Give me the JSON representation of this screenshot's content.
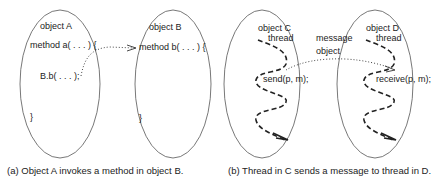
{
  "panel_a": {
    "object_a": {
      "title": "object A",
      "method_line": "method a( . . . ) {",
      "call_line": "B.b( . . . );",
      "close_brace": "}"
    },
    "object_b": {
      "title": "object B",
      "method_line": "method b( . . . ) {",
      "close_brace": "}"
    },
    "caption": "(a) Object A invokes a method in object B."
  },
  "panel_b": {
    "object_c": {
      "title": "object C",
      "thread_label": "thread",
      "send_line": "send(p, m);"
    },
    "object_d": {
      "title": "object D",
      "thread_label": "thread",
      "receive_line": "receive(p, m);"
    },
    "message_label_1": "message",
    "message_label_2": "object",
    "caption": "(b) Thread in C sends a message to thread in D."
  },
  "colors": {
    "ellipse_stroke": "#555555",
    "text": "#222222",
    "arrow": "#333333"
  }
}
